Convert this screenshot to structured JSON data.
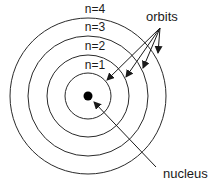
{
  "diagram": {
    "center": [
      88,
      96
    ],
    "nucleus": {
      "label": "nucleus",
      "radius": 4.5
    },
    "orbits_label": "orbits",
    "orbits": [
      {
        "label": "n=1",
        "radius": 23
      },
      {
        "label": "n=2",
        "radius": 41
      },
      {
        "label": "n=3",
        "radius": 60
      },
      {
        "label": "n=4",
        "radius": 78
      }
    ],
    "colors": {
      "stroke": "#2a2a2a",
      "fill": "#000000",
      "text": "#1a1a1a",
      "background": "#ffffff"
    }
  }
}
